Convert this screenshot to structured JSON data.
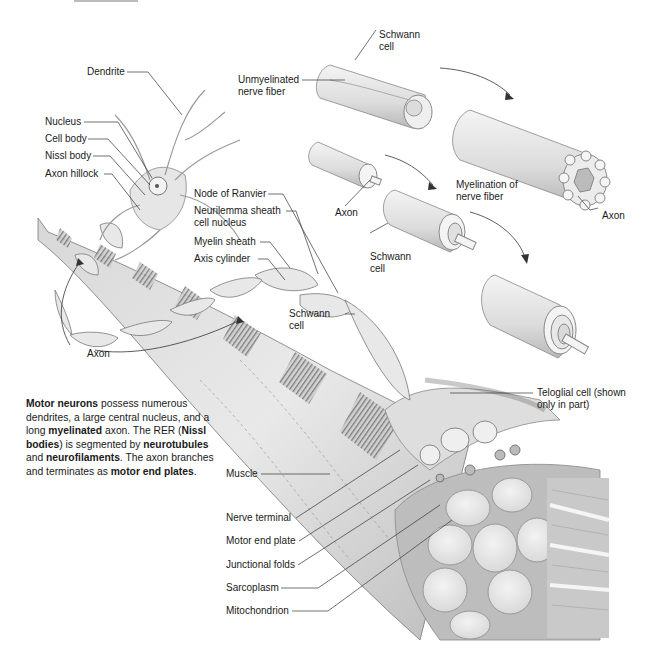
{
  "figure": {
    "colors": {
      "background": "#ffffff",
      "ink": "#1a1a1a",
      "tissue_light": "#e6e6e6",
      "tissue_mid": "#c8c8c8",
      "tissue_dark": "#8a8a8a"
    }
  },
  "labels": {
    "dendrite": "Dendrite",
    "nucleus": "Nucleus",
    "cell_body": "Cell body",
    "nissl_body": "Nissl body",
    "axon_hillock": "Axon hillock",
    "node_of_ranvier": "Node of Ranvier",
    "neurilemma_1": "Neurilemma sheath",
    "neurilemma_2": "cell nucleus",
    "myelin_sheath": "Myelin sheath",
    "axis_cylinder": "Axis cylinder",
    "axon_left": "Axon",
    "schwann_mid_1": "Schwann",
    "schwann_mid_2": "cell",
    "schwann_top_1": "Schwann",
    "schwann_top_2": "cell",
    "unmyelinated_1": "Unmyelinated",
    "unmyelinated_2": "nerve fiber",
    "axon_myelination": "Axon",
    "myelination_1": "Myelination of",
    "myelination_2": "nerve fiber",
    "axon_right": "Axon",
    "schwann_low_1": "Schwann",
    "schwann_low_2": "cell",
    "teloglial_1": "Teloglial cell (shown",
    "teloglial_2": "only in part)",
    "muscle": "Muscle",
    "nerve_terminal": "Nerve terminal",
    "motor_end_plate": "Motor end plate",
    "junctional_folds": "Junctional folds",
    "sarcoplasm": "Sarcoplasm",
    "mitochondrion": "Mitochondrion"
  },
  "caption": {
    "parts": [
      {
        "text": "Motor neurons",
        "bold": true
      },
      {
        "text": " possess numerous dendrites, a large central nucleus, and a long ",
        "bold": false
      },
      {
        "text": "myelinated",
        "bold": true
      },
      {
        "text": " axon. The RER (",
        "bold": false
      },
      {
        "text": "Nissl bodies",
        "bold": true
      },
      {
        "text": ") is segmented by ",
        "bold": false
      },
      {
        "text": "neurotubules",
        "bold": true
      },
      {
        "text": " and ",
        "bold": false
      },
      {
        "text": "neurofilaments",
        "bold": true
      },
      {
        "text": ". The axon branches and terminates as ",
        "bold": false
      },
      {
        "text": "motor end plates",
        "bold": true
      },
      {
        "text": ".",
        "bold": false
      }
    ]
  }
}
